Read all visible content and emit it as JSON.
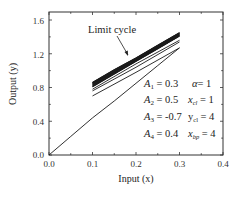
{
  "chart_data": {
    "type": "line",
    "title": "",
    "xlabel": "Input (x)",
    "ylabel": "Output (y)",
    "xlim": [
      0.0,
      0.4
    ],
    "ylim": [
      0.0,
      1.6
    ],
    "xticks": [
      "0.0",
      "0.1",
      "0.2",
      "0.3",
      "0.4"
    ],
    "yticks": [
      "0.0",
      "0.4",
      "0.8",
      "1.2",
      "1.6"
    ],
    "grid": false,
    "legend": null,
    "annotations": [
      {
        "text": "Limit cycle",
        "arrow_to": [
          0.2,
          1.1
        ]
      }
    ],
    "parameters": [
      {
        "left": "A1 = 0.3",
        "right": "α= 1"
      },
      {
        "left": "A2 = 0.5",
        "right": "xcl = 1"
      },
      {
        "left": "A3 = -0.7",
        "right": "ycl = 4"
      },
      {
        "left": "A4 = 0.4",
        "right": "xbp = 4"
      }
    ],
    "series": [
      {
        "name": "initial transient",
        "x": [
          0.0,
          0.05,
          0.1,
          0.15,
          0.2,
          0.25,
          0.3
        ],
        "y": [
          0.0,
          0.22,
          0.44,
          0.64,
          0.85,
          1.06,
          1.27
        ]
      },
      {
        "name": "transient return 1",
        "x": [
          0.3,
          0.2,
          0.1
        ],
        "y": [
          1.27,
          0.98,
          0.7
        ]
      },
      {
        "name": "transient 2",
        "x": [
          0.1,
          0.2,
          0.3
        ],
        "y": [
          0.76,
          1.04,
          1.34
        ]
      },
      {
        "name": "transient return 2",
        "x": [
          0.3,
          0.2,
          0.1
        ],
        "y": [
          1.36,
          1.08,
          0.78
        ]
      },
      {
        "name": "limit cycle upper",
        "x": [
          0.1,
          0.15,
          0.2,
          0.25,
          0.3
        ],
        "y": [
          0.86,
          1.01,
          1.15,
          1.3,
          1.45
        ]
      },
      {
        "name": "limit cycle lower",
        "x": [
          0.3,
          0.25,
          0.2,
          0.15,
          0.1
        ],
        "y": [
          1.41,
          1.26,
          1.11,
          0.96,
          0.81
        ]
      }
    ]
  },
  "labels": {
    "xlabel": "Input (x)",
    "ylabel": "Output (y)",
    "limit_cycle": "Limit cycle",
    "params": {
      "a1": {
        "sym": "A",
        "sub": "1",
        "val": " = 0.3"
      },
      "a2": {
        "sym": "A",
        "sub": "2",
        "val": " = 0.5"
      },
      "a3": {
        "sym": "A",
        "sub": "3",
        "val": " = -0.7"
      },
      "a4": {
        "sym": "A",
        "sub": "4",
        "val": " = 0.4"
      },
      "alpha": {
        "sym": "α",
        "sub": "",
        "val": "= 1"
      },
      "xcl": {
        "sym": "x",
        "sub": "cl",
        "val": " = 1"
      },
      "ycl": {
        "sym": "y",
        "sub": "cl",
        "val": " = 4"
      },
      "xbp": {
        "sym": "x",
        "sub": "bp",
        "val": " = 4"
      }
    },
    "xticks": [
      "0.0",
      "0.1",
      "0.2",
      "0.3",
      "0.4"
    ],
    "yticks": [
      "0.0",
      "0.4",
      "0.8",
      "1.2",
      "1.6"
    ]
  },
  "colors": {
    "line": "#1a1a1a",
    "axis": "#333333",
    "background": "#ffffff"
  }
}
